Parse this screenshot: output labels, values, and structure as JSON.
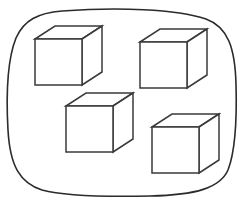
{
  "figure": {
    "background_color": "#ffffff",
    "outline_color": "#2b2b2b",
    "cube_stroke_color": "#3a3a3a",
    "cube_fill_color": "#ffffff",
    "stroke_width": 1.5,
    "object_count": 4,
    "object_name": "cube",
    "count_label": "4"
  },
  "enclosure": {
    "name": "rounded-blob",
    "shape": "rounded-rectangle",
    "bounds": {
      "x": 8,
      "y": 10,
      "width": 229,
      "height": 186
    },
    "corner_radius": 52,
    "path": "M 62 11 C 118 7 176 9 206 19 C 228 27 235 48 236 84 C 237 120 235 152 228 170 C 220 188 196 195 150 196 C 104 197 64 196 42 190 C 20 183 10 166 8 130 C 6 94 8 58 16 38 C 24 20 38 13 62 11 Z"
  },
  "cubes": [
    {
      "id": "cube-1",
      "label": "Cube 1",
      "position": "top-left",
      "front": {
        "x": 35,
        "y": 39,
        "width": 47,
        "height": 46
      },
      "depth": {
        "dx": 20,
        "dy": -13
      }
    },
    {
      "id": "cube-2",
      "label": "Cube 2",
      "position": "top-right",
      "front": {
        "x": 140,
        "y": 42,
        "width": 47,
        "height": 46
      },
      "depth": {
        "dx": 20,
        "dy": -13
      }
    },
    {
      "id": "cube-3",
      "label": "Cube 3",
      "position": "bottom-left",
      "front": {
        "x": 66,
        "y": 106,
        "width": 47,
        "height": 46
      },
      "depth": {
        "dx": 20,
        "dy": -13
      }
    },
    {
      "id": "cube-4",
      "label": "Cube 4",
      "position": "bottom-right",
      "front": {
        "x": 152,
        "y": 127,
        "width": 47,
        "height": 46
      },
      "depth": {
        "dx": 20,
        "dy": -13
      }
    }
  ]
}
